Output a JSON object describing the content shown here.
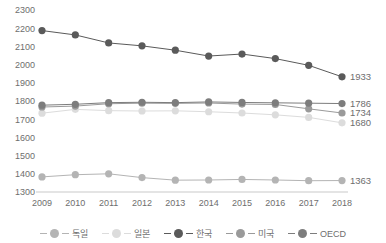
{
  "chart_data": {
    "type": "line",
    "title": "",
    "subtitle": "",
    "xlabel": "",
    "ylabel": "",
    "x": [
      "2009",
      "2010",
      "2011",
      "2012",
      "2013",
      "2014",
      "2015",
      "2016",
      "2017",
      "2018"
    ],
    "categories": [
      "2009",
      "2010",
      "2011",
      "2012",
      "2013",
      "2014",
      "2015",
      "2016",
      "2017",
      "2018"
    ],
    "ylim": [
      1300,
      2300
    ],
    "ytick_values": [
      1300,
      1400,
      1500,
      1600,
      1700,
      1800,
      1900,
      2000,
      2100,
      2200,
      2300
    ],
    "ytick_labels": [
      "1300",
      "1400",
      "1500",
      "1600",
      "1700",
      "1800",
      "1900",
      "2000",
      "2100",
      "2200",
      "2300"
    ],
    "grid": false,
    "legend_position": "bottom",
    "series": [
      {
        "name": "독일",
        "color": "#b4b4b4",
        "values": [
          1383,
          1395,
          1400,
          1379,
          1365,
          1366,
          1369,
          1366,
          1362,
          1363
        ],
        "end_label": "1363"
      },
      {
        "name": "일본",
        "color": "#dcdcdc",
        "values": [
          1733,
          1754,
          1747,
          1745,
          1746,
          1741,
          1734,
          1724,
          1710,
          1680
        ],
        "end_label": "1680"
      },
      {
        "name": "한국",
        "color": "#5a5a5a",
        "values": [
          2187,
          2163,
          2119,
          2103,
          2079,
          2047,
          2058,
          2033,
          1996,
          1933
        ],
        "end_label": "1933"
      },
      {
        "name": "미국",
        "color": "#9a9a9a",
        "values": [
          1767,
          1772,
          1785,
          1788,
          1787,
          1789,
          1783,
          1781,
          1757,
          1734
        ],
        "end_label": "1734"
      },
      {
        "name": "OECD",
        "color": "#7d7d7d",
        "values": [
          1777,
          1782,
          1791,
          1793,
          1791,
          1795,
          1792,
          1790,
          1788,
          1786
        ],
        "end_label": "1786"
      }
    ]
  },
  "legend": {
    "items": [
      {
        "label": "독일"
      },
      {
        "label": "일본"
      },
      {
        "label": "한국"
      },
      {
        "label": "미국"
      },
      {
        "label": "OECD"
      }
    ]
  }
}
